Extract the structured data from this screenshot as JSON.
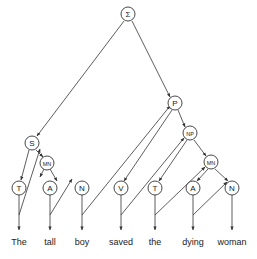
{
  "diagram": {
    "type": "parse-tree-traversal",
    "stroke_color": "#333333",
    "background": "#ffffff",
    "nodes": [
      {
        "id": "root",
        "label": "Σ",
        "x": 128,
        "y": 14,
        "r": 7
      },
      {
        "id": "S",
        "label": "S",
        "x": 32,
        "y": 143,
        "r": 7
      },
      {
        "id": "MN1",
        "label": "MN",
        "x": 47,
        "y": 163,
        "r": 7
      },
      {
        "id": "T1",
        "label": "T",
        "x": 19,
        "y": 188,
        "r": 7
      },
      {
        "id": "A1",
        "label": "A",
        "x": 50,
        "y": 188,
        "r": 7
      },
      {
        "id": "N1",
        "label": "N",
        "x": 82,
        "y": 188,
        "r": 7
      },
      {
        "id": "P",
        "label": "P",
        "x": 175,
        "y": 103,
        "r": 7
      },
      {
        "id": "NP",
        "label": "NP",
        "x": 190,
        "y": 133,
        "r": 7
      },
      {
        "id": "MN2",
        "label": "MN",
        "x": 211,
        "y": 162,
        "r": 7
      },
      {
        "id": "V",
        "label": "V",
        "x": 121,
        "y": 188,
        "r": 7
      },
      {
        "id": "T2",
        "label": "T",
        "x": 155,
        "y": 188,
        "r": 7
      },
      {
        "id": "A2",
        "label": "A",
        "x": 193,
        "y": 188,
        "r": 7
      },
      {
        "id": "N2",
        "label": "N",
        "x": 232,
        "y": 188,
        "r": 7
      }
    ],
    "words": [
      {
        "text": "The",
        "x": 19
      },
      {
        "text": "tall",
        "x": 50
      },
      {
        "text": "boy",
        "x": 82
      },
      {
        "text": "saved",
        "x": 121
      },
      {
        "text": "the",
        "x": 155
      },
      {
        "text": "dying",
        "x": 193
      },
      {
        "text": "woman",
        "x": 232
      }
    ],
    "word_y": 245,
    "arrows": [
      {
        "from": [
          124,
          21
        ],
        "to": [
          37,
          136
        ],
        "desc": "root to S"
      },
      {
        "from": [
          132,
          21
        ],
        "to": [
          170,
          97
        ],
        "desc": "root to P"
      },
      {
        "from": [
          29,
          150
        ],
        "to": [
          21,
          180
        ],
        "desc": "S to T1"
      },
      {
        "from": [
          36,
          150
        ],
        "to": [
          43,
          157
        ],
        "desc": "S to MN1"
      },
      {
        "from": [
          44,
          169
        ],
        "to": [
          40,
          177
        ],
        "desc": "MN1 to A1 side"
      },
      {
        "from": [
          50,
          169
        ],
        "to": [
          57,
          181
        ],
        "desc": "MN1 to N1 side"
      },
      {
        "from": [
          19,
          195
        ],
        "to": [
          19,
          230
        ],
        "desc": "T1 to word"
      },
      {
        "from": [
          19,
          215
        ],
        "to": [
          40,
          149
        ],
        "desc": "return T1 to MN1"
      },
      {
        "from": [
          50,
          195
        ],
        "to": [
          50,
          230
        ],
        "desc": "A1 to word"
      },
      {
        "from": [
          50,
          215
        ],
        "to": [
          72,
          179
        ],
        "desc": "return A1 to N1"
      },
      {
        "from": [
          82,
          195
        ],
        "to": [
          82,
          230
        ],
        "desc": "N1 to word"
      },
      {
        "from": [
          82,
          215
        ],
        "to": [
          170,
          106
        ],
        "desc": "return boy to P"
      },
      {
        "from": [
          172,
          110
        ],
        "to": [
          124,
          181
        ],
        "desc": "P to V"
      },
      {
        "from": [
          178,
          110
        ],
        "to": [
          185,
          127
        ],
        "desc": "P to NP"
      },
      {
        "from": [
          121,
          195
        ],
        "to": [
          121,
          230
        ],
        "desc": "V to word"
      },
      {
        "from": [
          121,
          215
        ],
        "to": [
          184,
          138
        ],
        "desc": "return saved to NP"
      },
      {
        "from": [
          187,
          140
        ],
        "to": [
          159,
          181
        ],
        "desc": "NP to T2"
      },
      {
        "from": [
          194,
          140
        ],
        "to": [
          206,
          156
        ],
        "desc": "NP to MN2"
      },
      {
        "from": [
          155,
          195
        ],
        "to": [
          155,
          230
        ],
        "desc": "T2 to word"
      },
      {
        "from": [
          155,
          215
        ],
        "to": [
          205,
          167
        ],
        "desc": "return the to MN2"
      },
      {
        "from": [
          208,
          169
        ],
        "to": [
          197,
          181
        ],
        "desc": "MN2 to A2"
      },
      {
        "from": [
          215,
          169
        ],
        "to": [
          228,
          181
        ],
        "desc": "MN2 to N2"
      },
      {
        "from": [
          193,
          195
        ],
        "to": [
          193,
          230
        ],
        "desc": "A2 to word"
      },
      {
        "from": [
          193,
          215
        ],
        "to": [
          227,
          182
        ],
        "desc": "return dying to N2"
      },
      {
        "from": [
          232,
          195
        ],
        "to": [
          232,
          230
        ],
        "desc": "N2 to word"
      }
    ]
  }
}
